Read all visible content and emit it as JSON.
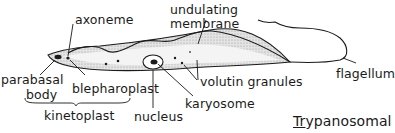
{
  "diagram": {
    "title": {
      "underlined_part": "Tr",
      "rest": "ypanosomal"
    },
    "labels": {
      "axoneme": "axoneme",
      "undulating_membrane_line1": "undulating",
      "undulating_membrane_line2": "membrane",
      "parabasal_body_line1": "parabasal",
      "parabasal_body_line2": "body",
      "blepharoplast": "blepharoplast",
      "kinetoplast": "kinetoplast",
      "nucleus": "nucleus",
      "karyosome": "karyosome",
      "volutin_granules": "volutin  granules",
      "flagellum": "flagellum"
    },
    "colors": {
      "ink": "#1a1a1a",
      "shading": "#c8c8c8",
      "background": "#ffffff"
    }
  }
}
